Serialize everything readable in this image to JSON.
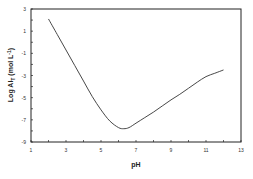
{
  "chart_data": {
    "type": "line",
    "title": "",
    "xlabel": "pH",
    "ylabel": "Log Al_T (mol L^-1)",
    "ylabel_parts": {
      "main": "Log Al",
      "sub": "T",
      "unit": " (mol L",
      "sup": "-1",
      "close": ")"
    },
    "xlim": [
      1,
      13
    ],
    "ylim": [
      -9,
      3
    ],
    "xticks": [
      1,
      3,
      5,
      7,
      9,
      11,
      13
    ],
    "yticks": [
      -9,
      -7,
      -5,
      -3,
      -1,
      1,
      3
    ],
    "grid": false,
    "legend": null,
    "series": [
      {
        "name": "Log Al_T",
        "color": "#333333",
        "x": [
          2.0,
          2.5,
          3.0,
          3.5,
          4.0,
          4.5,
          5.0,
          5.5,
          6.0,
          6.3,
          6.6,
          7.0,
          7.5,
          8.0,
          8.5,
          9.0,
          9.5,
          10.0,
          10.5,
          11.0,
          11.5,
          12.0
        ],
        "y": [
          2.1,
          0.7,
          -0.7,
          -2.1,
          -3.5,
          -4.9,
          -6.1,
          -7.1,
          -7.7,
          -7.8,
          -7.7,
          -7.3,
          -6.8,
          -6.3,
          -5.75,
          -5.2,
          -4.7,
          -4.15,
          -3.6,
          -3.1,
          -2.8,
          -2.5
        ]
      }
    ]
  }
}
